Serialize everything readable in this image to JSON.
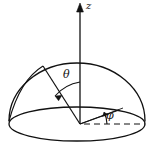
{
  "figure": {
    "type": "geometry-diagram",
    "canvas": {
      "width": 153,
      "height": 155,
      "background": "#ffffff"
    },
    "stroke_color": "#111111",
    "labels": {
      "z_axis": "z",
      "polar_angle": "θ",
      "azimuthal_angle": "φ"
    },
    "watermark": "",
    "geometry": {
      "origin": {
        "x": 80,
        "y": 124
      },
      "base_ellipse": {
        "cx": 77,
        "cy": 124,
        "rx": 68,
        "ry": 17
      },
      "dome_radius_x": 68,
      "dome_radius_y": 58,
      "z_axis": {
        "x": 80,
        "y_top": 4,
        "y_bottom": 124
      },
      "radial_vector_endpoint": {
        "x": 43,
        "y": 66
      },
      "projection_endpoint": {
        "x": 119,
        "y": 110
      },
      "dashed_reference_endpoint": {
        "x": 145,
        "y": 124
      },
      "theta_arc_degrees": 38,
      "phi_arc_degrees": 22
    }
  }
}
